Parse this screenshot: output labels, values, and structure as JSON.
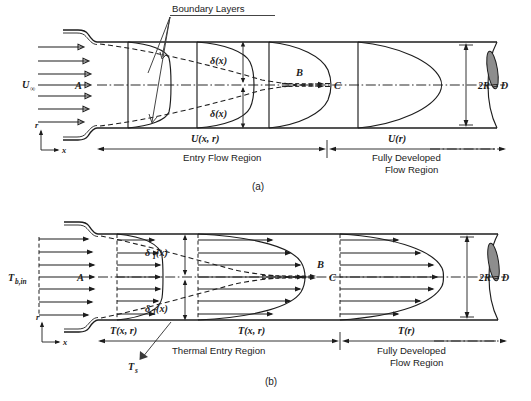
{
  "figure": {
    "panels": [
      {
        "id": "a",
        "caption": "(a)",
        "annotations": {
          "boundary_layers": "Boundary Layers",
          "inlet_velocity": "U",
          "inlet_velocity_sub": "∞",
          "point_a": "A",
          "point_b": "B",
          "point_c": "C",
          "delta_upper": "δ(x)",
          "delta_lower": "δ(x)",
          "profile_developing": "U(x, r)",
          "profile_developed": "U(r)",
          "diameter": "2R = D",
          "region_entry": "Entry Flow Region",
          "region_developed_line1": "Fully Developed",
          "region_developed_line2": "Flow Region",
          "axis_r": "r",
          "axis_x": "x"
        }
      },
      {
        "id": "b",
        "caption": "(b)",
        "annotations": {
          "inlet_temperature": "T",
          "inlet_temperature_sub": "b,in",
          "point_a": "A",
          "point_b": "B",
          "point_c": "C",
          "delta_t_upper": "δ",
          "delta_t_upper_sub": "T",
          "delta_t_upper_arg": "(x)",
          "delta_t_lower": "δ",
          "delta_t_lower_sub": "T",
          "delta_t_lower_arg": "(x)",
          "surface_temperature": "T",
          "surface_temperature_sub": "s",
          "profile_developing_left": "T(x, r)",
          "profile_developing_mid": "T(x, r)",
          "profile_developed": "T(r)",
          "diameter": "2R = D",
          "region_thermal_entry": "Thermal Entry Region",
          "region_developed_line1": "Fully Developed",
          "region_developed_line2": "Flow Region",
          "axis_r": "r",
          "axis_x": "x"
        }
      }
    ],
    "colors": {
      "ink": "#1d1d1d",
      "shade": "#8d8d8d",
      "background": "#ffffff"
    }
  }
}
